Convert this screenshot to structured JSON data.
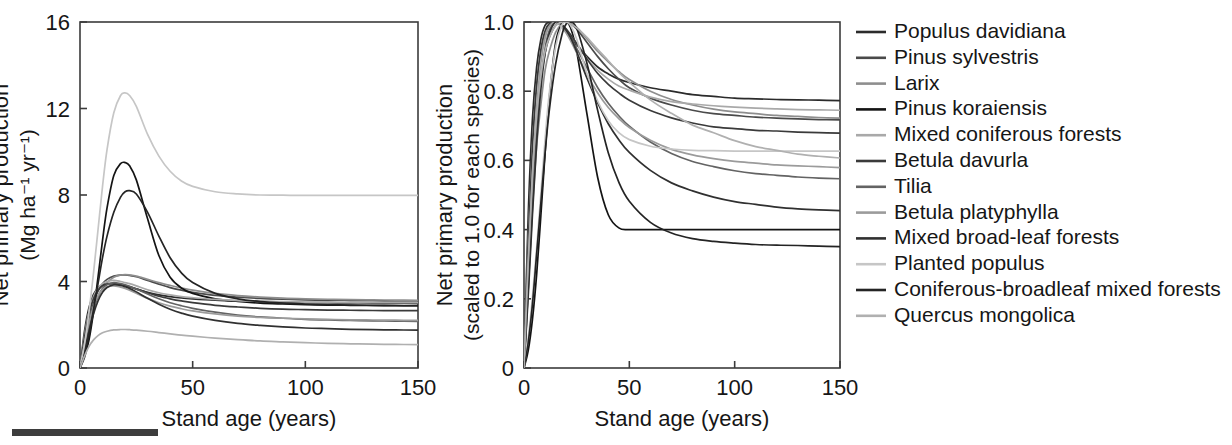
{
  "figure": {
    "background": "#ffffff",
    "footer_bar_color": "#3d3d3d"
  },
  "panels": {
    "left": {
      "name": "absolute-npp-panel",
      "x_axis": {
        "label": "Stand age (years)",
        "ticks": [
          0,
          50,
          100,
          150
        ],
        "tick_labels": [
          "0",
          "50",
          "100",
          "150"
        ],
        "range": [
          0,
          150
        ]
      },
      "y_axis": {
        "label_line1": "Net primary production",
        "label_line2": "(Mg ha⁻¹ yr⁻¹)",
        "ticks": [
          0,
          4,
          8,
          12,
          16
        ],
        "tick_labels": [
          "0",
          "4",
          "8",
          "12",
          "16"
        ],
        "range": [
          0,
          16
        ]
      }
    },
    "right": {
      "name": "scaled-npp-panel",
      "x_axis": {
        "label": "Stand age (years)",
        "ticks": [
          0,
          50,
          100,
          150
        ],
        "tick_labels": [
          "0",
          "50",
          "100",
          "150"
        ],
        "range": [
          0,
          150
        ]
      },
      "y_axis": {
        "label_line1": "Net primary production",
        "label_line2": "(scaled to 1.0 for each species)",
        "ticks": [
          0,
          0.2,
          0.4,
          0.6,
          0.8,
          1.0
        ],
        "tick_labels": [
          "0",
          "0.2",
          "0.4",
          "0.6",
          "0.8",
          "1.0"
        ],
        "range": [
          0,
          1.0
        ]
      }
    }
  },
  "legend": {
    "name": "species-legend",
    "entries": [
      {
        "label": "Populus davidiana",
        "color": "#2b2b2b"
      },
      {
        "label": "Pinus sylvestris",
        "color": "#4a4a4a"
      },
      {
        "label": "Larix",
        "color": "#8e8e8e"
      },
      {
        "label": "Pinus koraiensis",
        "color": "#141414"
      },
      {
        "label": "Mixed coniferous forests",
        "color": "#a9a9a9"
      },
      {
        "label": "Betula davurla",
        "color": "#3a3a3a"
      },
      {
        "label": "Tilia",
        "color": "#636363"
      },
      {
        "label": "Betula platyphylla",
        "color": "#9b9b9b"
      },
      {
        "label": "Mixed broad-leaf forests",
        "color": "#303030"
      },
      {
        "label": "Planted populus",
        "color": "#c6c6c6"
      },
      {
        "label": "Coniferous-broadleaf mixed forests",
        "color": "#242424"
      },
      {
        "label": "Quercus mongolica",
        "color": "#b0b0b0"
      }
    ]
  },
  "chart_data": [
    {
      "type": "line",
      "panel": "left",
      "title": "",
      "xlabel": "Stand age (years)",
      "ylabel": "Net primary production (Mg ha-1 yr-1)",
      "xlim": [
        0,
        150
      ],
      "ylim": [
        0,
        16
      ],
      "grid": false,
      "legend_position": "right-outside",
      "x": [
        0,
        2,
        4,
        6,
        8,
        10,
        12,
        15,
        18,
        20,
        22,
        25,
        30,
        35,
        40,
        45,
        50,
        60,
        70,
        80,
        90,
        100,
        110,
        120,
        130,
        140,
        150
      ],
      "series": [
        {
          "name": "Populus davidiana",
          "color": "#2b2b2b",
          "values": [
            0,
            1.7,
            2.8,
            3.4,
            3.7,
            3.85,
            3.9,
            3.9,
            3.85,
            3.8,
            3.75,
            3.65,
            3.5,
            3.38,
            3.3,
            3.24,
            3.2,
            3.14,
            3.1,
            3.07,
            3.05,
            3.03,
            3.02,
            3.01,
            3.0,
            3.0,
            3.0
          ]
        },
        {
          "name": "Pinus sylvestris",
          "color": "#4a4a4a",
          "values": [
            0,
            1.2,
            2.2,
            3.0,
            3.55,
            3.9,
            4.1,
            4.25,
            4.3,
            4.3,
            4.28,
            4.22,
            4.05,
            3.88,
            3.72,
            3.6,
            3.5,
            3.36,
            3.28,
            3.22,
            3.18,
            3.15,
            3.13,
            3.12,
            3.11,
            3.1,
            3.1
          ]
        },
        {
          "name": "Larix",
          "color": "#8e8e8e",
          "values": [
            0,
            1.0,
            2.0,
            2.75,
            3.3,
            3.7,
            3.95,
            4.2,
            4.3,
            4.32,
            4.3,
            4.25,
            4.1,
            3.95,
            3.82,
            3.7,
            3.6,
            3.45,
            3.35,
            3.28,
            3.23,
            3.2,
            3.18,
            3.16,
            3.15,
            3.14,
            3.13
          ]
        },
        {
          "name": "Pinus koraiensis",
          "color": "#141414",
          "values": [
            0,
            0.5,
            1.3,
            2.6,
            4.2,
            5.9,
            7.4,
            8.9,
            9.45,
            9.5,
            9.35,
            8.7,
            6.9,
            5.2,
            4.2,
            3.7,
            3.45,
            3.2,
            3.08,
            3.0,
            2.96,
            2.93,
            2.91,
            2.9,
            2.89,
            2.88,
            2.88
          ]
        },
        {
          "name": "Mixed coniferous forests",
          "color": "#a9a9a9",
          "values": [
            0,
            1.5,
            2.6,
            3.3,
            3.7,
            3.9,
            4.0,
            4.05,
            4.0,
            3.95,
            3.9,
            3.8,
            3.62,
            3.48,
            3.38,
            3.3,
            3.25,
            3.17,
            3.12,
            3.09,
            3.07,
            3.05,
            3.04,
            3.03,
            3.02,
            3.02,
            3.02
          ]
        },
        {
          "name": "Betula davurla",
          "color": "#3a3a3a",
          "values": [
            0,
            1.4,
            2.5,
            3.2,
            3.6,
            3.8,
            3.88,
            3.9,
            3.86,
            3.82,
            3.76,
            3.66,
            3.48,
            3.32,
            3.2,
            3.1,
            3.02,
            2.9,
            2.82,
            2.76,
            2.72,
            2.7,
            2.68,
            2.67,
            2.66,
            2.65,
            2.65
          ]
        },
        {
          "name": "Tilia",
          "color": "#636363",
          "values": [
            0,
            0.9,
            1.9,
            2.7,
            3.3,
            3.65,
            3.85,
            3.95,
            3.9,
            3.85,
            3.78,
            3.65,
            3.42,
            3.2,
            3.02,
            2.88,
            2.76,
            2.58,
            2.45,
            2.36,
            2.3,
            2.25,
            2.22,
            2.2,
            2.18,
            2.17,
            2.16
          ]
        },
        {
          "name": "Betula platyphylla",
          "color": "#9b9b9b",
          "values": [
            0,
            1.1,
            2.1,
            2.85,
            3.35,
            3.62,
            3.75,
            3.8,
            3.74,
            3.68,
            3.6,
            3.46,
            3.22,
            3.02,
            2.86,
            2.74,
            2.64,
            2.5,
            2.4,
            2.34,
            2.3,
            2.27,
            2.25,
            2.23,
            2.22,
            2.21,
            2.2
          ]
        },
        {
          "name": "Mixed broad-leaf forests",
          "color": "#303030",
          "values": [
            0,
            0.8,
            1.7,
            2.5,
            3.1,
            3.5,
            3.72,
            3.85,
            3.82,
            3.76,
            3.68,
            3.52,
            3.22,
            2.95,
            2.72,
            2.54,
            2.4,
            2.2,
            2.06,
            1.97,
            1.9,
            1.85,
            1.82,
            1.79,
            1.77,
            1.76,
            1.75
          ]
        },
        {
          "name": "Planted populus",
          "color": "#c6c6c6",
          "values": [
            0,
            1.1,
            2.6,
            4.4,
            6.4,
            8.4,
            10.1,
            11.8,
            12.6,
            12.72,
            12.6,
            12.1,
            10.8,
            9.8,
            9.1,
            8.65,
            8.4,
            8.15,
            8.05,
            8.0,
            7.99,
            7.98,
            7.98,
            7.98,
            7.98,
            7.98,
            7.98
          ]
        },
        {
          "name": "Coniferous-broadleaf mixed forests",
          "color": "#242424",
          "values": [
            0,
            0.6,
            1.5,
            2.7,
            3.9,
            5.1,
            6.1,
            7.2,
            7.9,
            8.15,
            8.2,
            8.05,
            7.2,
            6.1,
            5.1,
            4.4,
            3.95,
            3.45,
            3.2,
            3.07,
            3.0,
            2.96,
            2.93,
            2.91,
            2.9,
            2.89,
            2.88
          ]
        },
        {
          "name": "Quercus mongolica",
          "color": "#b0b0b0",
          "values": [
            0,
            0.55,
            1.0,
            1.3,
            1.5,
            1.63,
            1.7,
            1.76,
            1.78,
            1.78,
            1.77,
            1.75,
            1.7,
            1.64,
            1.58,
            1.52,
            1.47,
            1.38,
            1.31,
            1.25,
            1.21,
            1.17,
            1.14,
            1.12,
            1.1,
            1.09,
            1.08
          ]
        }
      ]
    },
    {
      "type": "line",
      "panel": "right",
      "title": "",
      "xlabel": "Stand age (years)",
      "ylabel": "Net primary production (scaled to 1.0 for each species)",
      "xlim": [
        0,
        150
      ],
      "ylim": [
        0,
        1.0
      ],
      "grid": false,
      "legend_position": "right-outside",
      "x": [
        0,
        2,
        4,
        6,
        8,
        10,
        12,
        15,
        18,
        20,
        22,
        25,
        30,
        35,
        40,
        45,
        50,
        60,
        70,
        80,
        90,
        100,
        110,
        120,
        130,
        140,
        150
      ],
      "series": [
        {
          "name": "Populus davidiana",
          "color": "#2b2b2b",
          "values": [
            0,
            0.44,
            0.72,
            0.87,
            0.95,
            0.99,
            1.0,
            1.0,
            0.99,
            0.975,
            0.96,
            0.935,
            0.9,
            0.87,
            0.85,
            0.835,
            0.825,
            0.81,
            0.8,
            0.79,
            0.785,
            0.78,
            0.778,
            0.776,
            0.775,
            0.774,
            0.773
          ]
        },
        {
          "name": "Pinus sylvestris",
          "color": "#4a4a4a",
          "values": [
            0,
            0.28,
            0.51,
            0.7,
            0.83,
            0.91,
            0.955,
            0.99,
            1.0,
            1.0,
            0.995,
            0.98,
            0.94,
            0.9,
            0.865,
            0.835,
            0.81,
            0.78,
            0.76,
            0.745,
            0.735,
            0.73,
            0.725,
            0.722,
            0.72,
            0.718,
            0.717
          ]
        },
        {
          "name": "Larix",
          "color": "#8e8e8e",
          "values": [
            0,
            0.23,
            0.46,
            0.64,
            0.76,
            0.86,
            0.915,
            0.97,
            0.995,
            1.0,
            0.995,
            0.985,
            0.95,
            0.915,
            0.885,
            0.857,
            0.834,
            0.8,
            0.776,
            0.76,
            0.748,
            0.74,
            0.735,
            0.73,
            0.727,
            0.724,
            0.722
          ]
        },
        {
          "name": "Pinus koraiensis",
          "color": "#141414",
          "values": [
            0,
            0.05,
            0.14,
            0.27,
            0.44,
            0.62,
            0.78,
            0.94,
            0.995,
            1.0,
            0.985,
            0.915,
            0.73,
            0.55,
            0.443,
            0.405,
            0.4,
            0.4,
            0.4,
            0.4,
            0.4,
            0.4,
            0.4,
            0.4,
            0.4,
            0.4,
            0.4
          ]
        },
        {
          "name": "Mixed coniferous forests",
          "color": "#a9a9a9",
          "values": [
            0,
            0.37,
            0.64,
            0.81,
            0.91,
            0.96,
            0.99,
            1.0,
            0.99,
            0.975,
            0.963,
            0.938,
            0.894,
            0.86,
            0.835,
            0.815,
            0.803,
            0.783,
            0.77,
            0.763,
            0.758,
            0.754,
            0.751,
            0.749,
            0.747,
            0.746,
            0.745
          ]
        },
        {
          "name": "Betula davurla",
          "color": "#3a3a3a",
          "values": [
            0,
            0.36,
            0.64,
            0.82,
            0.92,
            0.974,
            0.995,
            1.0,
            0.99,
            0.98,
            0.964,
            0.938,
            0.892,
            0.851,
            0.82,
            0.795,
            0.774,
            0.744,
            0.723,
            0.708,
            0.697,
            0.692,
            0.687,
            0.685,
            0.682,
            0.68,
            0.679
          ]
        },
        {
          "name": "Tilia",
          "color": "#636363",
          "values": [
            0,
            0.228,
            0.481,
            0.684,
            0.835,
            0.924,
            0.975,
            1.0,
            0.987,
            0.975,
            0.957,
            0.924,
            0.866,
            0.81,
            0.765,
            0.729,
            0.699,
            0.653,
            0.62,
            0.597,
            0.582,
            0.57,
            0.562,
            0.557,
            0.552,
            0.549,
            0.547
          ]
        },
        {
          "name": "Betula platyphylla",
          "color": "#9b9b9b",
          "values": [
            0,
            0.29,
            0.553,
            0.75,
            0.882,
            0.953,
            0.987,
            1.0,
            0.984,
            0.968,
            0.947,
            0.911,
            0.847,
            0.795,
            0.753,
            0.721,
            0.695,
            0.658,
            0.632,
            0.616,
            0.605,
            0.597,
            0.592,
            0.587,
            0.584,
            0.582,
            0.579
          ]
        },
        {
          "name": "Mixed broad-leaf forests",
          "color": "#303030",
          "values": [
            0,
            0.208,
            0.442,
            0.649,
            0.805,
            0.909,
            0.966,
            1.0,
            0.992,
            0.977,
            0.956,
            0.914,
            0.836,
            0.766,
            0.706,
            0.66,
            0.623,
            0.571,
            0.535,
            0.512,
            0.494,
            0.481,
            0.473,
            0.465,
            0.46,
            0.457,
            0.455
          ]
        },
        {
          "name": "Planted populus",
          "color": "#c6c6c6",
          "values": [
            0,
            0.086,
            0.204,
            0.346,
            0.503,
            0.66,
            0.794,
            0.928,
            0.991,
            1.0,
            0.991,
            0.951,
            0.849,
            0.771,
            0.715,
            0.68,
            0.66,
            0.641,
            0.633,
            0.629,
            0.628,
            0.627,
            0.627,
            0.627,
            0.627,
            0.627,
            0.627
          ]
        },
        {
          "name": "Coniferous-broadleaf mixed forests",
          "color": "#242424",
          "values": [
            0,
            0.073,
            0.183,
            0.329,
            0.476,
            0.622,
            0.744,
            0.878,
            0.963,
            0.994,
            1.0,
            0.982,
            0.878,
            0.744,
            0.622,
            0.537,
            0.482,
            0.421,
            0.39,
            0.374,
            0.366,
            0.361,
            0.357,
            0.355,
            0.354,
            0.352,
            0.351
          ]
        },
        {
          "name": "Quercus mongolica",
          "color": "#b0b0b0",
          "values": [
            0,
            0.309,
            0.562,
            0.73,
            0.843,
            0.916,
            0.955,
            0.989,
            1.0,
            1.0,
            0.994,
            0.983,
            0.955,
            0.921,
            0.888,
            0.854,
            0.826,
            0.775,
            0.736,
            0.702,
            0.68,
            0.657,
            0.64,
            0.629,
            0.618,
            0.612,
            0.607
          ]
        }
      ]
    }
  ]
}
